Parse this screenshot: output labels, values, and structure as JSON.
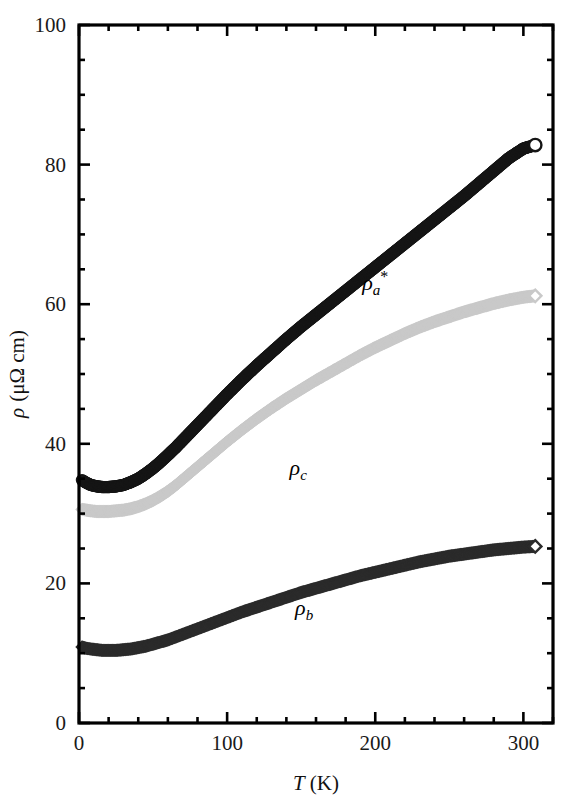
{
  "figure": {
    "background_color": "#ffffff",
    "frame_color": "#000000"
  },
  "chart_data": {
    "type": "scatter",
    "title": "",
    "xlabel": "T (K)",
    "xlabel_parts": {
      "symbol": "T",
      "unit": "(K)"
    },
    "ylabel": "ρ (μΩ cm)",
    "ylabel_parts": {
      "symbol": "ρ",
      "unit": "(μΩ cm)"
    },
    "xlim": [
      0,
      320
    ],
    "ylim": [
      0,
      100
    ],
    "xticks": [
      0,
      100,
      200,
      300
    ],
    "xtick_labels": [
      "0",
      "100",
      "200",
      "300"
    ],
    "xminor_step": 20,
    "yticks": [
      0,
      20,
      40,
      60,
      80,
      100
    ],
    "ytick_labels": [
      "0",
      "20",
      "40",
      "60",
      "80",
      "100"
    ],
    "yminor_step": 5,
    "grid": false,
    "legend_position": "inline-annotations",
    "series": [
      {
        "name": "ρ_a*",
        "label_symbol": "ρ",
        "label_sub": "a",
        "label_sup": "*",
        "marker": "open-circle",
        "color": "#151515",
        "label_x": 200,
        "label_y": 62,
        "x": [
          2,
          5,
          8,
          12,
          16,
          20,
          25,
          30,
          35,
          40,
          45,
          50,
          55,
          60,
          65,
          70,
          75,
          80,
          85,
          90,
          95,
          100,
          110,
          120,
          130,
          140,
          150,
          160,
          170,
          180,
          190,
          200,
          210,
          220,
          230,
          240,
          250,
          260,
          270,
          280,
          290,
          300,
          308
        ],
        "y": [
          34.8,
          34.4,
          34.1,
          33.9,
          33.8,
          33.8,
          33.9,
          34.1,
          34.5,
          35.0,
          35.7,
          36.5,
          37.4,
          38.4,
          39.4,
          40.5,
          41.6,
          42.7,
          43.8,
          44.9,
          46.0,
          47.1,
          49.2,
          51.2,
          53.1,
          55.0,
          56.8,
          58.5,
          60.2,
          61.9,
          63.6,
          65.3,
          67.0,
          68.7,
          70.4,
          72.1,
          73.8,
          75.5,
          77.3,
          79.1,
          80.9,
          82.3,
          82.8
        ]
      },
      {
        "name": "ρ_c",
        "label_symbol": "ρ",
        "label_sub": "c",
        "label_sup": "",
        "marker": "open-diamond",
        "color": "#c9c9c9",
        "label_x": 148,
        "label_y": 35.5,
        "x": [
          2,
          5,
          8,
          12,
          16,
          20,
          25,
          30,
          35,
          40,
          45,
          50,
          55,
          60,
          65,
          70,
          75,
          80,
          85,
          90,
          95,
          100,
          110,
          120,
          130,
          140,
          150,
          160,
          170,
          180,
          190,
          200,
          210,
          220,
          230,
          240,
          250,
          260,
          270,
          280,
          290,
          300,
          308
        ],
        "y": [
          30.6,
          30.5,
          30.4,
          30.3,
          30.3,
          30.3,
          30.4,
          30.5,
          30.7,
          31.0,
          31.4,
          31.9,
          32.5,
          33.2,
          34.0,
          34.9,
          35.8,
          36.7,
          37.6,
          38.5,
          39.4,
          40.3,
          42.0,
          43.6,
          45.1,
          46.5,
          47.8,
          49.1,
          50.3,
          51.5,
          52.7,
          53.8,
          54.8,
          55.8,
          56.7,
          57.5,
          58.2,
          58.9,
          59.5,
          60.1,
          60.6,
          61.0,
          61.2
        ]
      },
      {
        "name": "ρ_b",
        "label_symbol": "ρ",
        "label_sub": "b",
        "label_sup": "",
        "marker": "open-diamond",
        "color": "#2b2b2b",
        "label_x": 152,
        "label_y": 15.5,
        "x": [
          2,
          5,
          8,
          12,
          16,
          20,
          25,
          30,
          35,
          40,
          45,
          50,
          55,
          60,
          65,
          70,
          75,
          80,
          85,
          90,
          95,
          100,
          110,
          120,
          130,
          140,
          150,
          160,
          170,
          180,
          190,
          200,
          210,
          220,
          230,
          240,
          250,
          260,
          270,
          280,
          290,
          300,
          308
        ],
        "y": [
          10.9,
          10.7,
          10.6,
          10.5,
          10.4,
          10.4,
          10.4,
          10.5,
          10.6,
          10.8,
          11.0,
          11.3,
          11.6,
          11.9,
          12.3,
          12.7,
          13.1,
          13.5,
          13.9,
          14.3,
          14.7,
          15.1,
          15.9,
          16.6,
          17.3,
          18.0,
          18.7,
          19.3,
          19.9,
          20.5,
          21.1,
          21.6,
          22.1,
          22.6,
          23.1,
          23.5,
          23.9,
          24.2,
          24.5,
          24.8,
          25.0,
          25.2,
          25.3
        ]
      }
    ]
  }
}
